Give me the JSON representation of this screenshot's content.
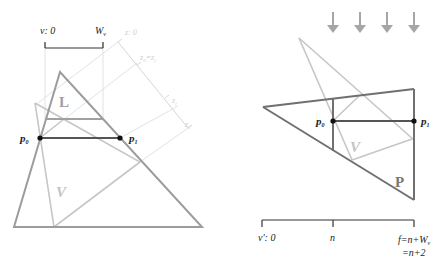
{
  "left": {
    "v_axis": {
      "start_label": "v: 0",
      "end_label": "W",
      "end_sub": "v"
    },
    "z_axis": {
      "labels": [
        {
          "text": "z: 0"
        },
        {
          "text": "z",
          "sub": "0",
          "suffix": "=z",
          "suffix_sub": "f"
        },
        {
          "text": "z",
          "sub": "f"
        },
        {
          "text": "z",
          "sub": "1"
        }
      ]
    },
    "region_L": "L",
    "region_V": "V",
    "points": {
      "p0": {
        "text": "p",
        "sub": "0"
      },
      "p1": {
        "text": "p",
        "sub": "1"
      }
    }
  },
  "right": {
    "region_P": "P",
    "region_V": "V",
    "points": {
      "p0": {
        "text": "p",
        "sub": "0"
      },
      "p1": {
        "text": "p",
        "sub": "1"
      }
    },
    "axis": {
      "start_label": "v': 0",
      "mid_label": "n",
      "end_label_line1": "f=n+W",
      "end_label_sub": "v",
      "end_label_line2": "=n+2"
    },
    "arrows_count": 4
  },
  "colors": {
    "dark": "#555555",
    "medium": "#9a9a9a",
    "light": "#c4c4c4",
    "faint": "#dcdcdc",
    "point": "#111111"
  }
}
